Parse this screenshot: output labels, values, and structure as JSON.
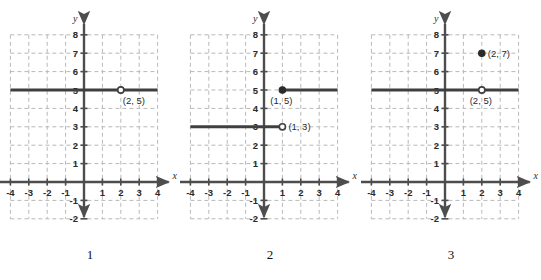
{
  "figure": {
    "background_color": "#ffffff",
    "line_color": "#3f3f3f",
    "grid_color": "#b9b9b9",
    "axis_color": "#4d4d4d",
    "panel_count": 3
  },
  "chart_data": {
    "type": "scatter",
    "title": "",
    "panels": [
      {
        "caption": "1",
        "xlabel": "x",
        "ylabel": "y",
        "xlim": [
          -4,
          4
        ],
        "ylim": [
          -2,
          8
        ],
        "x_ticks": [
          "-4",
          "-3",
          "-2",
          "-1",
          "1",
          "2",
          "3",
          "4"
        ],
        "y_ticks": [
          "8",
          "7",
          "6",
          "5",
          "4",
          "3",
          "2",
          "1",
          "-1",
          "-2"
        ],
        "grid": true,
        "segments": [
          {
            "y": 5,
            "x_start": -4,
            "x_end": 4
          }
        ],
        "points": [
          {
            "x": 2,
            "y": 5,
            "style": "open",
            "label": "(2, 5)",
            "label_pos": "below-right"
          }
        ]
      },
      {
        "caption": "2",
        "xlabel": "x",
        "ylabel": "y",
        "xlim": [
          -4,
          4
        ],
        "ylim": [
          -2,
          8
        ],
        "x_ticks": [
          "-4",
          "-3",
          "-2",
          "-1",
          "1",
          "2",
          "3",
          "4"
        ],
        "y_ticks": [
          "8",
          "7",
          "6",
          "5",
          "4",
          "3",
          "2",
          "1",
          "-1",
          "-2"
        ],
        "grid": true,
        "segments": [
          {
            "y": 5,
            "x_start": 1,
            "x_end": 4
          },
          {
            "y": 3,
            "x_start": -4,
            "x_end": 1
          }
        ],
        "points": [
          {
            "x": 1,
            "y": 5,
            "style": "closed",
            "label": "(1, 5)",
            "label_pos": "below-left"
          },
          {
            "x": 1,
            "y": 3,
            "style": "open",
            "label": "(1, 3)",
            "label_pos": "right"
          }
        ]
      },
      {
        "caption": "3",
        "xlabel": "x",
        "ylabel": "y",
        "xlim": [
          -4,
          4
        ],
        "ylim": [
          -2,
          8
        ],
        "x_ticks": [
          "-4",
          "-3",
          "-2",
          "-1",
          "1",
          "2",
          "3",
          "4"
        ],
        "y_ticks": [
          "8",
          "7",
          "6",
          "5",
          "4",
          "3",
          "2",
          "1",
          "-1",
          "-2"
        ],
        "grid": true,
        "segments": [
          {
            "y": 5,
            "x_start": -4,
            "x_end": 4
          }
        ],
        "points": [
          {
            "x": 2,
            "y": 7,
            "style": "closed",
            "label": "(2, 7)",
            "label_pos": "right"
          },
          {
            "x": 2,
            "y": 5,
            "style": "open",
            "label": "(2, 5)",
            "label_pos": "below-left"
          }
        ]
      }
    ]
  }
}
